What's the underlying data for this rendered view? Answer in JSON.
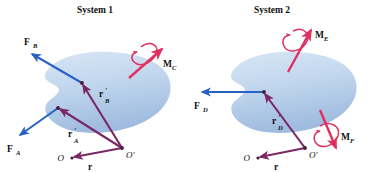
{
  "figure": {
    "background_color": "#ffffff",
    "body_fill_top": "#cfe0f2",
    "body_fill_bottom": "#a9c4e4",
    "force_color": "#2a62c4",
    "position_color": "#7b2766",
    "moment_color": "#e03060",
    "text_color": "#111111"
  },
  "systems": [
    {
      "id": "system-1",
      "title": "System 1",
      "title_pos": {
        "x": 95,
        "y": 13
      },
      "body": {
        "name": "rigid-body-1",
        "center": {
          "x": 92,
          "y": 92
        }
      },
      "points": [
        {
          "name": "point-A",
          "label": "A",
          "x": 58,
          "y": 108,
          "visible_label": false
        },
        {
          "name": "point-B",
          "label": "B",
          "x": 82,
          "y": 83,
          "visible_label": false
        },
        {
          "name": "point-O-prime",
          "label": "O'",
          "x": 122,
          "y": 148,
          "visible_label": true,
          "label_pos": {
            "x": 125,
            "y": 157
          }
        },
        {
          "name": "point-O",
          "label": "O",
          "x": 72,
          "y": 158,
          "visible_label": true,
          "label_pos": {
            "x": 62,
            "y": 160
          }
        }
      ],
      "vectors": [
        {
          "name": "force-FB",
          "kind": "force",
          "label": "F",
          "subscript": "B",
          "from": {
            "x": 82,
            "y": 83
          },
          "to": {
            "x": 30,
            "y": 53
          },
          "label_pos": {
            "x": 28,
            "y": 42
          }
        },
        {
          "name": "force-FA",
          "kind": "force",
          "label": "F",
          "subscript": "A",
          "from": {
            "x": 58,
            "y": 108
          },
          "to": {
            "x": 18,
            "y": 136
          },
          "label_pos": {
            "x": 11,
            "y": 150
          }
        },
        {
          "name": "position-rB-prime",
          "kind": "position",
          "label": "r",
          "subscript": "B",
          "prime": true,
          "from": {
            "x": 122,
            "y": 148
          },
          "to": {
            "x": 82,
            "y": 83
          },
          "label_pos": {
            "x": 101,
            "y": 96
          }
        },
        {
          "name": "position-rA-prime",
          "kind": "position",
          "label": "r",
          "subscript": "A",
          "prime": true,
          "from": {
            "x": 122,
            "y": 148
          },
          "to": {
            "x": 58,
            "y": 108
          },
          "label_pos": {
            "x": 72,
            "y": 136
          }
        },
        {
          "name": "position-r",
          "kind": "position",
          "label": "r",
          "subscript": "",
          "prime": false,
          "from": {
            "x": 122,
            "y": 148
          },
          "to": {
            "x": 72,
            "y": 158
          },
          "label_pos": {
            "x": 89,
            "y": 167
          }
        }
      ],
      "moments": [
        {
          "name": "moment-MC",
          "label": "M",
          "subscript": "C",
          "from": {
            "x": 129,
            "y": 76
          },
          "to": {
            "x": 163,
            "y": 48
          },
          "label_pos": {
            "x": 164,
            "y": 64
          },
          "spin": "double-headed-curl"
        }
      ]
    },
    {
      "id": "system-2",
      "title": "System 2",
      "title_pos": {
        "x": 272,
        "y": 13
      },
      "body": {
        "name": "rigid-body-2",
        "center": {
          "x": 278,
          "y": 92
        }
      },
      "points": [
        {
          "name": "point-D",
          "label": "D",
          "x": 264,
          "y": 92,
          "visible_label": false
        },
        {
          "name": "point-O-prime",
          "label": "O'",
          "x": 305,
          "y": 148,
          "visible_label": true,
          "label_pos": {
            "x": 308,
            "y": 157
          }
        },
        {
          "name": "point-O",
          "label": "O",
          "x": 258,
          "y": 158,
          "visible_label": true,
          "label_pos": {
            "x": 248,
            "y": 160
          }
        }
      ],
      "vectors": [
        {
          "name": "force-FD",
          "kind": "force",
          "label": "F",
          "subscript": "D",
          "from": {
            "x": 264,
            "y": 92
          },
          "to": {
            "x": 200,
            "y": 92
          },
          "label_pos": {
            "x": 198,
            "y": 107
          }
        },
        {
          "name": "position-rD-prime",
          "kind": "position",
          "label": "r",
          "subscript": "D",
          "prime": true,
          "from": {
            "x": 305,
            "y": 148
          },
          "to": {
            "x": 264,
            "y": 92
          },
          "label_pos": {
            "x": 274,
            "y": 124
          }
        },
        {
          "name": "position-r",
          "kind": "position",
          "label": "r",
          "subscript": "",
          "prime": false,
          "from": {
            "x": 305,
            "y": 148
          },
          "to": {
            "x": 258,
            "y": 158
          },
          "label_pos": {
            "x": 275,
            "y": 167
          }
        }
      ],
      "moments": [
        {
          "name": "moment-ME",
          "label": "M",
          "subscript": "E",
          "from": {
            "x": 288,
            "y": 70
          },
          "to": {
            "x": 312,
            "y": 28
          },
          "label_pos": {
            "x": 315,
            "y": 37
          },
          "spin": "double-headed-curl"
        },
        {
          "name": "moment-MF",
          "label": "M",
          "subscript": "F",
          "from": {
            "x": 321,
            "y": 110
          },
          "to": {
            "x": 338,
            "y": 150
          },
          "label_pos": {
            "x": 340,
            "y": 140
          },
          "spin": "double-headed-curl"
        }
      ]
    }
  ]
}
